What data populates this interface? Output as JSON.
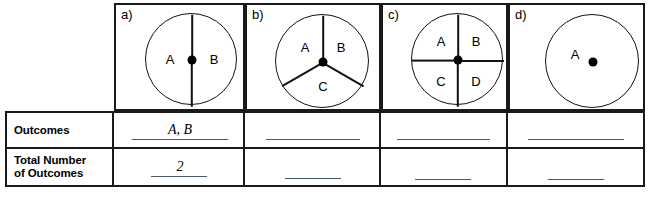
{
  "worksheet": {
    "title": "Spinner Outcomes Table",
    "row_labels": {
      "outcomes": "Outcomes",
      "total_line1": "Total Number",
      "total_line2": "of Outcomes"
    },
    "columns": [
      {
        "key": "a",
        "letter": "a)",
        "spinner": {
          "type": "halves",
          "sections": 2,
          "section_labels": [
            "A",
            "B"
          ],
          "divider_angles_deg": [
            90,
            270
          ]
        },
        "answers": {
          "outcomes": "A, B",
          "total": "2"
        }
      },
      {
        "key": "b",
        "letter": "b)",
        "spinner": {
          "type": "thirds",
          "sections": 3,
          "section_labels": [
            "A",
            "B",
            "C"
          ],
          "divider_angles_deg": [
            90,
            210,
            330
          ]
        },
        "answers": {
          "outcomes": "",
          "total": ""
        }
      },
      {
        "key": "c",
        "letter": "c)",
        "spinner": {
          "type": "quarters",
          "sections": 4,
          "section_labels": [
            "A",
            "B",
            "C",
            "D"
          ],
          "divider_angles_deg": [
            0,
            90,
            180,
            270
          ]
        },
        "answers": {
          "outcomes": "",
          "total": ""
        }
      },
      {
        "key": "d",
        "letter": "d)",
        "spinner": {
          "type": "whole",
          "sections": 1,
          "section_labels": [
            "A"
          ],
          "divider_angles_deg": []
        },
        "answers": {
          "outcomes": "",
          "total": ""
        }
      }
    ],
    "colors": {
      "ink": "#1a1a1a",
      "paper": "#ffffff",
      "blank_line": "#4a5a6a"
    }
  }
}
